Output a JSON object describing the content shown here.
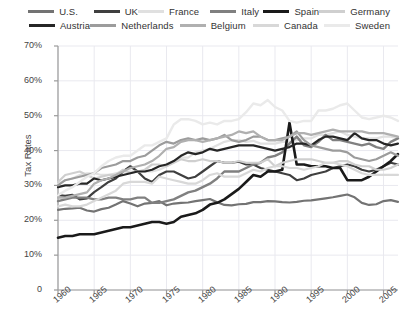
{
  "chart_data": {
    "type": "line",
    "title": "",
    "xlabel": "",
    "ylabel": "Tax Rates",
    "xlim": [
      1960,
      2007
    ],
    "ylim": [
      0,
      70
    ],
    "ytick_labels": [
      "70%",
      "60%",
      "50%",
      "40%",
      "30%",
      "20%",
      "10%",
      "0"
    ],
    "ytick_values": [
      70,
      60,
      50,
      40,
      30,
      20,
      10,
      0
    ],
    "xtick_labels": [
      "1960",
      "1965",
      "1970",
      "1975",
      "1980",
      "1985",
      "1990",
      "1995",
      "2000",
      "2005"
    ],
    "xtick_values": [
      1960,
      1965,
      1970,
      1975,
      1980,
      1985,
      1990,
      1995,
      2000,
      2005
    ],
    "grid": true,
    "legend_position": "top",
    "x": [
      1960,
      1961,
      1962,
      1963,
      1964,
      1965,
      1966,
      1967,
      1968,
      1969,
      1970,
      1971,
      1972,
      1973,
      1974,
      1975,
      1976,
      1977,
      1978,
      1979,
      1980,
      1981,
      1982,
      1983,
      1984,
      1985,
      1986,
      1987,
      1988,
      1989,
      1990,
      1991,
      1992,
      1993,
      1994,
      1995,
      1996,
      1997,
      1998,
      1999,
      2000,
      2001,
      2002,
      2003,
      2004,
      2005,
      2006,
      2007
    ],
    "series": [
      {
        "name": "U.S.",
        "color": "#737373",
        "width": 2.2,
        "values": [
          23.0,
          23.3,
          23.4,
          23.6,
          22.8,
          22.5,
          23.2,
          23.6,
          24.5,
          25.5,
          24.8,
          24.0,
          24.8,
          25.0,
          25.5,
          24.3,
          24.8,
          25.0,
          25.1,
          25.5,
          25.8,
          26.1,
          25.2,
          24.4,
          24.3,
          24.6,
          24.7,
          25.2,
          25.2,
          25.5,
          25.4,
          25.2,
          25.1,
          25.3,
          25.6,
          25.7,
          26.0,
          26.3,
          26.6,
          27.0,
          27.4,
          26.6,
          25.0,
          24.4,
          24.6,
          25.5,
          25.8,
          25.3
        ]
      },
      {
        "name": "UK",
        "color": "#3f3f3f",
        "width": 2.2,
        "values": [
          27.2,
          27.0,
          27.3,
          26.0,
          26.3,
          28.1,
          29.5,
          31.0,
          32.0,
          34.0,
          35.5,
          34.0,
          32.0,
          31.0,
          33.0,
          34.0,
          34.0,
          33.0,
          32.0,
          32.5,
          34.0,
          35.5,
          37.0,
          36.5,
          36.5,
          36.8,
          36.0,
          36.0,
          35.0,
          34.5,
          34.0,
          33.5,
          33.0,
          31.5,
          32.0,
          33.0,
          33.5,
          34.0,
          35.0,
          35.5,
          36.0,
          35.5,
          34.5,
          34.0,
          34.5,
          35.5,
          36.5,
          36.0
        ]
      },
      {
        "name": "France",
        "color": "#e0e0e0",
        "width": 2.2,
        "values": [
          30.5,
          31.5,
          32.0,
          33.0,
          33.5,
          33.5,
          33.0,
          33.0,
          33.5,
          34.0,
          34.0,
          34.0,
          34.0,
          34.0,
          34.5,
          35.5,
          37.0,
          38.0,
          38.0,
          39.5,
          40.0,
          40.5,
          41.5,
          42.5,
          43.0,
          43.0,
          42.5,
          42.8,
          42.0,
          42.0,
          42.0,
          42.5,
          42.5,
          43.0,
          43.5,
          43.5,
          44.5,
          44.5,
          45.0,
          45.5,
          44.5,
          44.0,
          43.5,
          43.5,
          43.5,
          44.0,
          44.0,
          43.5
        ]
      },
      {
        "name": "Italy",
        "color": "#808080",
        "width": 2.4,
        "values": [
          25.5,
          26.0,
          26.5,
          26.5,
          26.5,
          26.0,
          26.0,
          26.5,
          26.5,
          26.0,
          26.0,
          26.5,
          26.5,
          25.0,
          25.0,
          25.5,
          26.0,
          27.0,
          28.0,
          28.5,
          29.5,
          30.5,
          32.0,
          34.0,
          34.0,
          34.0,
          35.0,
          36.0,
          36.5,
          38.0,
          38.5,
          39.5,
          42.0,
          44.0,
          41.5,
          41.0,
          42.5,
          44.5,
          43.0,
          43.0,
          42.5,
          42.0,
          41.5,
          42.0,
          41.0,
          40.5,
          42.5,
          43.5
        ]
      },
      {
        "name": "Spain",
        "color": "#1a1a1a",
        "width": 2.6,
        "values": [
          15.0,
          15.5,
          15.5,
          16.0,
          16.0,
          16.0,
          16.5,
          17.0,
          17.5,
          18.0,
          18.0,
          18.5,
          19.0,
          19.5,
          19.5,
          19.0,
          19.5,
          21.0,
          21.5,
          22.0,
          23.0,
          24.5,
          25.0,
          26.0,
          27.5,
          29.0,
          31.0,
          33.0,
          32.5,
          34.0,
          34.0,
          34.5,
          48.0,
          36.0,
          36.0,
          35.5,
          35.5,
          35.5,
          35.0,
          35.0,
          31.5,
          31.5,
          31.5,
          32.5,
          34.0,
          35.5,
          37.0,
          39.0
        ]
      },
      {
        "name": "Germany",
        "color": "#cfcfcf",
        "width": 2.2,
        "values": [
          31.0,
          33.0,
          33.5,
          34.0,
          33.0,
          32.0,
          32.5,
          33.0,
          33.0,
          34.5,
          33.5,
          34.0,
          34.5,
          36.0,
          36.0,
          35.5,
          36.5,
          37.5,
          37.0,
          37.0,
          37.5,
          37.0,
          37.0,
          36.5,
          36.5,
          37.0,
          36.5,
          36.5,
          36.5,
          37.5,
          35.5,
          36.5,
          37.0,
          37.5,
          37.5,
          37.5,
          37.0,
          36.5,
          36.5,
          37.0,
          37.0,
          36.0,
          35.5,
          35.5,
          34.5,
          34.5,
          35.0,
          36.0
        ]
      },
      {
        "name": "Austria",
        "color": "#262626",
        "width": 2.2,
        "values": [
          29.5,
          30.0,
          30.0,
          30.5,
          30.5,
          32.0,
          31.5,
          32.0,
          32.5,
          33.0,
          33.5,
          34.0,
          34.0,
          34.5,
          35.5,
          36.0,
          37.0,
          38.5,
          39.5,
          39.0,
          39.5,
          40.5,
          40.0,
          40.5,
          41.0,
          41.5,
          41.5,
          41.5,
          41.0,
          40.5,
          40.0,
          40.5,
          41.0,
          42.0,
          42.0,
          41.5,
          43.0,
          44.0,
          44.0,
          43.5,
          43.0,
          45.0,
          43.5,
          43.0,
          43.0,
          42.0,
          41.5,
          42.0
        ]
      },
      {
        "name": "Netherlands",
        "color": "#9c9c9c",
        "width": 2.2,
        "values": [
          30.0,
          31.5,
          32.0,
          32.5,
          33.0,
          33.5,
          35.0,
          35.5,
          36.0,
          37.0,
          37.0,
          38.0,
          38.5,
          40.0,
          41.5,
          42.5,
          42.0,
          43.0,
          43.5,
          43.0,
          43.5,
          43.0,
          43.5,
          44.5,
          43.0,
          42.5,
          43.0,
          44.0,
          44.0,
          43.0,
          43.0,
          43.5,
          44.0,
          45.5,
          43.0,
          41.5,
          41.0,
          40.5,
          40.0,
          40.0,
          39.5,
          38.0,
          37.5,
          37.0,
          37.5,
          38.5,
          39.5,
          38.5
        ]
      },
      {
        "name": "Belgium",
        "color": "#b0b0b0",
        "width": 2.2,
        "values": [
          26.5,
          26.5,
          27.0,
          27.5,
          28.0,
          30.5,
          31.5,
          32.0,
          33.0,
          34.0,
          35.0,
          35.5,
          36.0,
          37.0,
          38.5,
          40.5,
          41.0,
          42.5,
          43.0,
          43.0,
          42.5,
          43.0,
          43.5,
          44.0,
          44.5,
          45.5,
          45.0,
          45.5,
          44.0,
          43.0,
          43.0,
          43.0,
          44.0,
          45.0,
          45.0,
          44.5,
          45.0,
          45.5,
          46.0,
          45.5,
          45.5,
          45.5,
          45.5,
          45.0,
          45.0,
          45.0,
          44.5,
          44.0
        ]
      },
      {
        "name": "Canada",
        "color": "#d8d8d8",
        "width": 2.2,
        "values": [
          24.0,
          24.5,
          24.0,
          24.0,
          24.5,
          25.5,
          26.5,
          27.5,
          28.5,
          30.5,
          31.0,
          31.0,
          31.0,
          30.5,
          32.5,
          32.0,
          31.5,
          31.0,
          30.5,
          30.5,
          31.5,
          33.0,
          33.5,
          32.5,
          32.5,
          32.5,
          33.5,
          34.5,
          34.0,
          35.0,
          35.5,
          35.5,
          35.0,
          35.0,
          34.5,
          35.0,
          35.5,
          36.5,
          36.5,
          36.0,
          35.5,
          34.5,
          33.5,
          33.0,
          33.0,
          33.0,
          33.0,
          33.0
        ]
      },
      {
        "name": "Sweden",
        "color": "#eaeaea",
        "width": 2.4,
        "values": [
          27.2,
          28.5,
          29.5,
          31.0,
          32.5,
          33.5,
          35.5,
          37.0,
          38.0,
          38.5,
          38.5,
          40.0,
          41.5,
          41.5,
          42.5,
          43.5,
          47.5,
          49.0,
          49.0,
          48.5,
          47.5,
          48.0,
          47.5,
          48.5,
          48.5,
          49.0,
          51.0,
          53.5,
          53.0,
          54.5,
          52.5,
          51.5,
          48.5,
          48.0,
          48.5,
          48.5,
          51.5,
          51.5,
          52.0,
          53.0,
          53.5,
          51.5,
          49.5,
          49.0,
          49.5,
          50.0,
          49.5,
          48.5
        ]
      }
    ],
    "legend_rows": [
      [
        "U.S.",
        "UK",
        "France",
        "Italy",
        "Spain",
        "Germany"
      ],
      [
        "Austria",
        "Netherlands",
        "Belgium",
        "Canada",
        "Sweden"
      ]
    ]
  }
}
